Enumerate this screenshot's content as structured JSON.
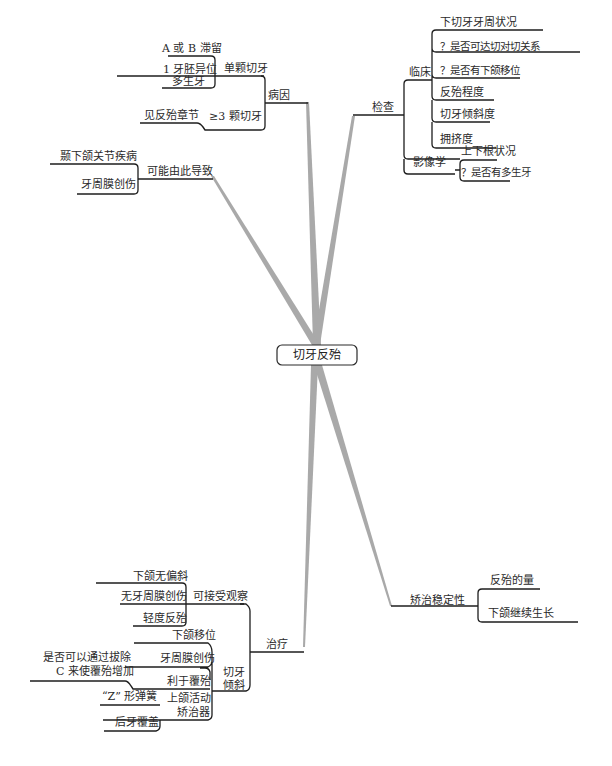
{
  "root": {
    "label": "切牙反殆"
  },
  "branches": {
    "cause": {
      "label": "病因",
      "single_incisor": {
        "label": "单颗切牙",
        "items": [
          "A 或 B 滞留",
          "1 牙胚异位",
          "多生牙"
        ]
      },
      "multi_incisor": {
        "label": "≥3 颗切牙",
        "items": [
          "见反殆章节"
        ]
      }
    },
    "consequence": {
      "label": "可能由此导致",
      "items": [
        "颞下颌关节疾病",
        "牙周膜创伤"
      ]
    },
    "exam": {
      "label": "检查",
      "clinical": {
        "label": "临床",
        "items": [
          "下切牙牙周状况",
          "？是否可达切对切关系",
          "？是否有下颌移位",
          "反殆程度",
          "切牙倾斜度",
          "拥挤度"
        ]
      },
      "imaging": {
        "label": "影像学",
        "items": [
          "上下根状况",
          "？是否有多生牙"
        ]
      }
    },
    "stability": {
      "label": "矫治稳定性",
      "items": [
        "反殆的量",
        "下颌继续生长"
      ]
    },
    "treatment": {
      "label": "治疗",
      "observe": {
        "label": "可接受观察",
        "items": [
          "下颌无偏斜",
          "无牙周膜创伤",
          "轻度反殆"
        ]
      },
      "tilt": {
        "label_line1": "切牙",
        "label_line2": "倾斜",
        "items": [
          "下颌移位",
          "牙周膜创伤",
          "利于覆殆"
        ],
        "extract_note_line1": "是否可以通过拔除",
        "extract_note_line2": "C 来使覆殆增加"
      },
      "appliance": {
        "label_line1": "上颌活动",
        "label_line2": "矫治器",
        "items": [
          "“Z” 形弹簧",
          "后牙覆盖"
        ]
      }
    }
  }
}
